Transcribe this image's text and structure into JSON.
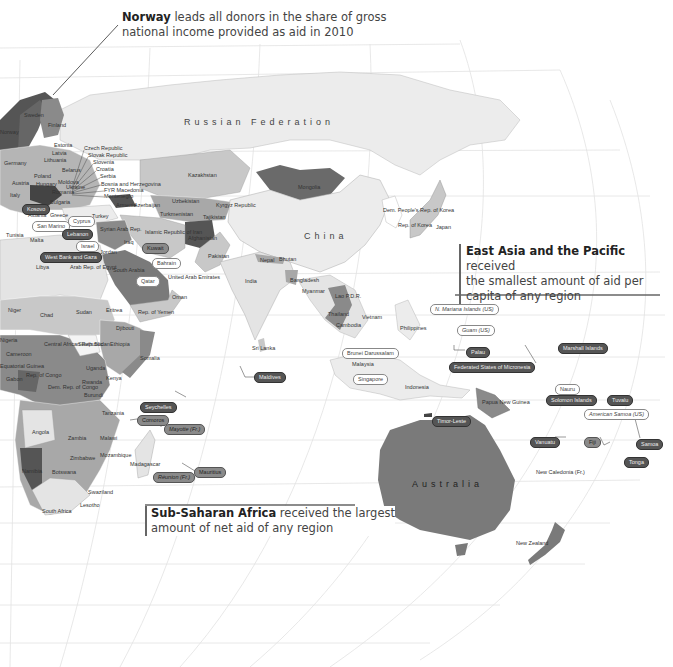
{
  "callouts": {
    "norway": {
      "bold": "Norway",
      "line1": " leads all donors in the share of gross",
      "line2": "national income provided as aid in 2010"
    },
    "east_asia": {
      "bold": "East Asia and the Pacific",
      "line1": " received",
      "line2": "the smallest amount of aid per",
      "line3": "capita of any region"
    },
    "africa": {
      "bold": "Sub-Saharan Africa",
      "line1": " received the largest",
      "line2": "amount of net aid of any region"
    }
  },
  "region_labels": {
    "russia": "Russian Federation",
    "china": "China",
    "australia": "Australia"
  },
  "country_labels": [
    {
      "name": "Sweden",
      "x": 24,
      "y": 113
    },
    {
      "name": "Norway",
      "x": 0,
      "y": 130
    },
    {
      "name": "Finland",
      "x": 48,
      "y": 123
    },
    {
      "name": "Estonia",
      "x": 54,
      "y": 143
    },
    {
      "name": "Latvia",
      "x": 52,
      "y": 151
    },
    {
      "name": "Lithuania",
      "x": 44,
      "y": 158
    },
    {
      "name": "Poland",
      "x": 34,
      "y": 174
    },
    {
      "name": "Belarus",
      "x": 62,
      "y": 168
    },
    {
      "name": "Germany",
      "x": 4,
      "y": 161
    },
    {
      "name": "Austria",
      "x": 12,
      "y": 181
    },
    {
      "name": "Hungary",
      "x": 36,
      "y": 182
    },
    {
      "name": "Ukraine",
      "x": 66,
      "y": 185
    },
    {
      "name": "Moldova",
      "x": 58,
      "y": 180
    },
    {
      "name": "Romania",
      "x": 52,
      "y": 190
    },
    {
      "name": "Bulgaria",
      "x": 50,
      "y": 200
    },
    {
      "name": "Italy",
      "x": 10,
      "y": 193
    },
    {
      "name": "Albania",
      "x": 28,
      "y": 213
    },
    {
      "name": "Greece",
      "x": 50,
      "y": 213
    },
    {
      "name": "Turkey",
      "x": 92,
      "y": 214
    },
    {
      "name": "Armenia",
      "x": 116,
      "y": 203
    },
    {
      "name": "Azerbaijan",
      "x": 134,
      "y": 203
    },
    {
      "name": "Tunisia",
      "x": 6,
      "y": 233
    },
    {
      "name": "Malta",
      "x": 30,
      "y": 238
    },
    {
      "name": "Syrian Arab Rep.",
      "x": 100,
      "y": 227
    },
    {
      "name": "Iraq",
      "x": 124,
      "y": 240
    },
    {
      "name": "Jordan",
      "x": 100,
      "y": 250
    },
    {
      "name": "Libya",
      "x": 36,
      "y": 265
    },
    {
      "name": "Arab Rep. of Egypt",
      "x": 70,
      "y": 265
    },
    {
      "name": "South Arabia",
      "x": 113,
      "y": 268
    },
    {
      "name": "United Arab Emirates",
      "x": 168,
      "y": 275
    },
    {
      "name": "Oman",
      "x": 172,
      "y": 295
    },
    {
      "name": "Rep. of Yemen",
      "x": 138,
      "y": 310
    },
    {
      "name": "Islamic Republic of Iran",
      "x": 145,
      "y": 230
    },
    {
      "name": "Turkmenistan",
      "x": 160,
      "y": 212
    },
    {
      "name": "Uzbekistan",
      "x": 172,
      "y": 199
    },
    {
      "name": "Kazakhstan",
      "x": 188,
      "y": 173
    },
    {
      "name": "Kyrgyz Republic",
      "x": 216,
      "y": 203
    },
    {
      "name": "Tajikistan",
      "x": 203,
      "y": 215
    },
    {
      "name": "Afghanistan",
      "x": 188,
      "y": 236
    },
    {
      "name": "Pakistan",
      "x": 208,
      "y": 254
    },
    {
      "name": "Mongolia",
      "x": 298,
      "y": 185
    },
    {
      "name": "Dem. People's Rep. of Korea",
      "x": 383,
      "y": 208
    },
    {
      "name": "Rep. of Korea",
      "x": 398,
      "y": 223
    },
    {
      "name": "Japan",
      "x": 436,
      "y": 225
    },
    {
      "name": "Nepal",
      "x": 260,
      "y": 258
    },
    {
      "name": "Bhutan",
      "x": 279,
      "y": 257
    },
    {
      "name": "India",
      "x": 245,
      "y": 279
    },
    {
      "name": "Bangladesh",
      "x": 290,
      "y": 278
    },
    {
      "name": "Myanmar",
      "x": 302,
      "y": 289
    },
    {
      "name": "Lao P.D.R.",
      "x": 335,
      "y": 294
    },
    {
      "name": "Thailand",
      "x": 328,
      "y": 312
    },
    {
      "name": "Vietnam",
      "x": 362,
      "y": 315
    },
    {
      "name": "Cambodia",
      "x": 336,
      "y": 323
    },
    {
      "name": "Philippines",
      "x": 400,
      "y": 326
    },
    {
      "name": "Sri Lanka",
      "x": 252,
      "y": 346
    },
    {
      "name": "Malaysia",
      "x": 352,
      "y": 362
    },
    {
      "name": "Indonesia",
      "x": 405,
      "y": 385
    },
    {
      "name": "Papua New Guinea",
      "x": 482,
      "y": 400
    },
    {
      "name": "Niger",
      "x": 8,
      "y": 308
    },
    {
      "name": "Chad",
      "x": 40,
      "y": 313
    },
    {
      "name": "Sudan",
      "x": 76,
      "y": 310
    },
    {
      "name": "Eritrea",
      "x": 106,
      "y": 308
    },
    {
      "name": "Djibouti",
      "x": 116,
      "y": 326
    },
    {
      "name": "Ethiopia",
      "x": 110,
      "y": 342
    },
    {
      "name": "Somalia",
      "x": 140,
      "y": 356
    },
    {
      "name": "South Sudan",
      "x": 78,
      "y": 342
    },
    {
      "name": "Central African Republic",
      "x": 44,
      "y": 342
    },
    {
      "name": "Cameroon",
      "x": 6,
      "y": 352
    },
    {
      "name": "Nigeria",
      "x": 0,
      "y": 338
    },
    {
      "name": "Equatorial Guinea",
      "x": 0,
      "y": 364
    },
    {
      "name": "Gabon",
      "x": 6,
      "y": 377
    },
    {
      "name": "Rep. of Congo",
      "x": 26,
      "y": 373
    },
    {
      "name": "Uganda",
      "x": 86,
      "y": 366
    },
    {
      "name": "Kenya",
      "x": 106,
      "y": 376
    },
    {
      "name": "Rwanda",
      "x": 82,
      "y": 380
    },
    {
      "name": "Burundi",
      "x": 84,
      "y": 393
    },
    {
      "name": "Dem. Rep. of Congo",
      "x": 48,
      "y": 385
    },
    {
      "name": "Tanzania",
      "x": 102,
      "y": 411
    },
    {
      "name": "Angola",
      "x": 32,
      "y": 430
    },
    {
      "name": "Zambia",
      "x": 68,
      "y": 436
    },
    {
      "name": "Malawi",
      "x": 100,
      "y": 436
    },
    {
      "name": "Zimbabwe",
      "x": 70,
      "y": 456
    },
    {
      "name": "Mozambique",
      "x": 100,
      "y": 453
    },
    {
      "name": "Madagascar",
      "x": 130,
      "y": 462
    },
    {
      "name": "Namibia",
      "x": 22,
      "y": 469
    },
    {
      "name": "Botswana",
      "x": 52,
      "y": 470
    },
    {
      "name": "Swaziland",
      "x": 88,
      "y": 490
    },
    {
      "name": "Lesotho",
      "x": 80,
      "y": 503
    },
    {
      "name": "South Africa",
      "x": 42,
      "y": 509
    },
    {
      "name": "New Zealand",
      "x": 516,
      "y": 541
    },
    {
      "name": "New Caledonia (Fr.)",
      "x": 536,
      "y": 470
    }
  ],
  "leader_labels_europe": [
    "Czech Republic",
    "Slovak Republic",
    "Slovenia",
    "Croatia",
    "Serbia",
    "Bosnia and Herzegovina",
    "FYR Macedonia",
    "Montenegro"
  ],
  "pills": [
    {
      "name": "Kosovo",
      "style": "dark",
      "x": 22,
      "y": 204
    },
    {
      "name": "San Marino",
      "style": "light",
      "x": 32,
      "y": 221
    },
    {
      "name": "Cyprus",
      "style": "light",
      "x": 68,
      "y": 216
    },
    {
      "name": "Lebanon",
      "style": "dark",
      "x": 62,
      "y": 229
    },
    {
      "name": "Israel",
      "style": "light",
      "x": 76,
      "y": 241
    },
    {
      "name": "West Bank and Gaza",
      "style": "dark",
      "x": 40,
      "y": 252
    },
    {
      "name": "Kuwait",
      "style": "mid",
      "x": 142,
      "y": 243
    },
    {
      "name": "Bahrain",
      "style": "light",
      "x": 152,
      "y": 258
    },
    {
      "name": "Qatar",
      "style": "light",
      "x": 136,
      "y": 276
    },
    {
      "name": "Maldives",
      "style": "dark",
      "x": 254,
      "y": 372
    },
    {
      "name": "Brunei Darussalam",
      "style": "light",
      "x": 342,
      "y": 348
    },
    {
      "name": "Singapore",
      "style": "light",
      "x": 353,
      "y": 374
    },
    {
      "name": "N. Mariana Islands (US)",
      "style": "light",
      "italic": true,
      "x": 430,
      "y": 304
    },
    {
      "name": "Guam (US)",
      "style": "light",
      "italic": true,
      "x": 457,
      "y": 325
    },
    {
      "name": "Palau",
      "style": "dark",
      "x": 466,
      "y": 347
    },
    {
      "name": "Federated States of Micronesia",
      "style": "dark",
      "x": 449,
      "y": 362
    },
    {
      "name": "Marshall Islands",
      "style": "dark",
      "x": 558,
      "y": 343
    },
    {
      "name": "Nauru",
      "style": "light",
      "x": 555,
      "y": 384
    },
    {
      "name": "Solomon Islands",
      "style": "dark",
      "x": 546,
      "y": 395
    },
    {
      "name": "Tuvalu",
      "style": "dark",
      "x": 607,
      "y": 395
    },
    {
      "name": "American Samoa (US)",
      "style": "light",
      "italic": true,
      "x": 584,
      "y": 409
    },
    {
      "name": "Timor-Leste",
      "style": "dark",
      "x": 432,
      "y": 416
    },
    {
      "name": "Vanuatu",
      "style": "dark",
      "x": 530,
      "y": 437
    },
    {
      "name": "Fiji",
      "style": "mid",
      "x": 584,
      "y": 437
    },
    {
      "name": "Samoa",
      "style": "dark",
      "x": 636,
      "y": 439
    },
    {
      "name": "Tonga",
      "style": "dark",
      "x": 624,
      "y": 457
    },
    {
      "name": "Seychelles",
      "style": "dark",
      "x": 140,
      "y": 402
    },
    {
      "name": "Comoros",
      "style": "mid",
      "x": 137,
      "y": 415
    },
    {
      "name": "Mayotte (Fr.)",
      "style": "mid",
      "italic": true,
      "x": 164,
      "y": 424
    },
    {
      "name": "Réunion (Fr.)",
      "style": "mid",
      "italic": true,
      "x": 153,
      "y": 472
    },
    {
      "name": "Mauritius",
      "style": "mid",
      "x": 194,
      "y": 467
    }
  ],
  "colors": {
    "ocean": "#ffffff",
    "land_light": "#e8e8e8",
    "land_mid_light": "#c8c8c8",
    "land_mid": "#a8a8a8",
    "land_dark": "#7a7a7a",
    "land_darkest": "#555555",
    "grid": "#dedede",
    "callout_rule": "#666666"
  }
}
